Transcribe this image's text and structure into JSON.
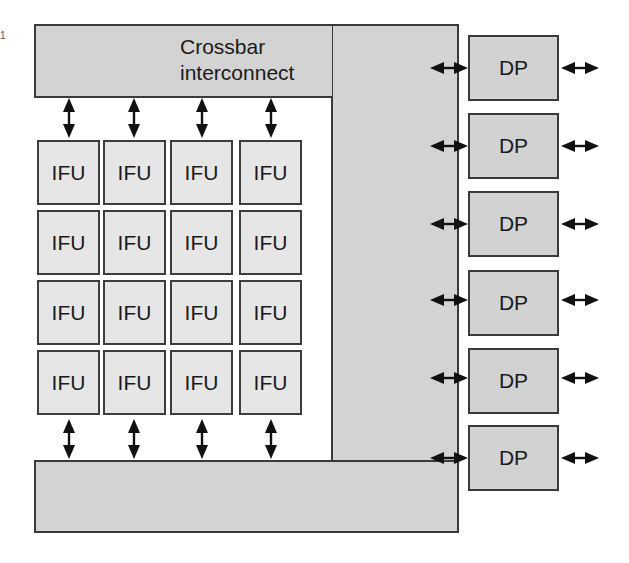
{
  "diagram": {
    "crossbar": {
      "label_line1": "Crossbar",
      "label_line2": "interconnect"
    },
    "ifu_grid": {
      "rows": 4,
      "cols": 4,
      "cells": [
        [
          "IFU",
          "IFU",
          "IFU",
          "IFU"
        ],
        [
          "IFU",
          "IFU",
          "IFU",
          "IFU"
        ],
        [
          "IFU",
          "IFU",
          "IFU",
          "IFU"
        ],
        [
          "IFU",
          "IFU",
          "IFU",
          "IFU"
        ]
      ]
    },
    "dps": [
      "DP",
      "DP",
      "DP",
      "DP",
      "DP",
      "DP"
    ],
    "side_mark": "1",
    "colors": {
      "crossbar_fill": "#d3d3d3",
      "ifu_fill": "#e6e6e6",
      "dp_fill": "#d2d2d2",
      "stroke": "#3a3a3a"
    }
  }
}
